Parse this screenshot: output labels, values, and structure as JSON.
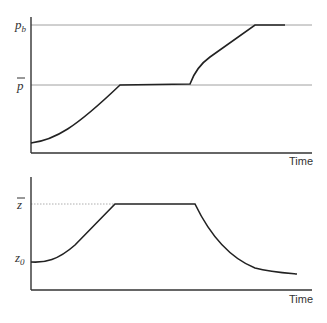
{
  "panels": [
    {
      "id": "top",
      "y_labels": {
        "upper": "p",
        "upper_sub": "b",
        "middle": "p"
      },
      "x_label": "Time",
      "description": "Curve starts low, rises smoothly to p-bar, stays flat, then rises to p_b and stays flat"
    },
    {
      "id": "bottom",
      "y_labels": {
        "upper": "z",
        "lower": "z",
        "lower_sub": "0"
      },
      "x_label": "Time",
      "description": "Curve starts at z_0, rises to z-bar, stays flat, then decays back toward z_0"
    }
  ]
}
